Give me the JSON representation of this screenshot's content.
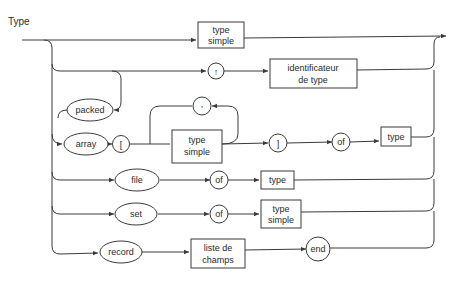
{
  "diagram": {
    "title": "Type",
    "nodes": {
      "type_simple_top": {
        "line1": "type",
        "line2": "simple",
        "kind": "non-terminal"
      },
      "pointer": {
        "label": "↑",
        "kind": "terminal"
      },
      "identificateur": {
        "line1": "identificateur",
        "line2": "de type",
        "kind": "non-terminal"
      },
      "packed": {
        "label": "packed",
        "kind": "keyword"
      },
      "array": {
        "label": "array",
        "kind": "keyword"
      },
      "lbracket": {
        "label": "[",
        "kind": "terminal"
      },
      "comma": {
        "label": ",",
        "kind": "terminal"
      },
      "type_simple_array": {
        "line1": "type",
        "line2": "simple",
        "kind": "non-terminal"
      },
      "rbracket": {
        "label": "]",
        "kind": "terminal"
      },
      "of_array": {
        "label": "of",
        "kind": "terminal"
      },
      "type_array": {
        "label": "type",
        "kind": "non-terminal"
      },
      "file": {
        "label": "file",
        "kind": "keyword"
      },
      "of_file": {
        "label": "of",
        "kind": "terminal"
      },
      "type_file": {
        "label": "type",
        "kind": "non-terminal"
      },
      "set": {
        "label": "set",
        "kind": "keyword"
      },
      "of_set": {
        "label": "of",
        "kind": "terminal"
      },
      "type_simple_set": {
        "line1": "type",
        "line2": "simple",
        "kind": "non-terminal"
      },
      "record": {
        "label": "record",
        "kind": "keyword"
      },
      "liste_champs": {
        "line1": "liste de",
        "line2": "champs",
        "kind": "non-terminal"
      },
      "end": {
        "label": "end",
        "kind": "terminal"
      }
    },
    "colors": {
      "line": "#3a3a3a",
      "text": "#2a2a2a",
      "background": "#ffffff"
    }
  }
}
